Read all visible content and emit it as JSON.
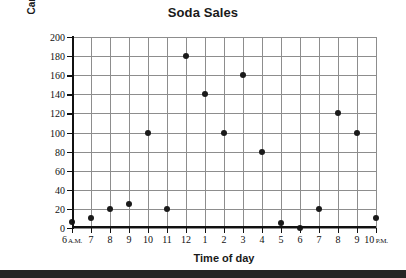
{
  "chart_data": {
    "type": "scatter",
    "title": "Soda Sales",
    "xlabel": "Time of day",
    "ylabel": "Cans sold per hour",
    "grid": true,
    "legend": null,
    "ylim": [
      0,
      200
    ],
    "yticks": [
      0,
      20,
      40,
      60,
      80,
      100,
      120,
      140,
      160,
      180,
      200
    ],
    "ytick_labels": [
      "0",
      "20",
      "40",
      "60",
      "80",
      "100",
      "120",
      "140",
      "160",
      "180",
      "200"
    ],
    "categories": [
      "6 A.M.",
      "7",
      "8",
      "9",
      "10",
      "11",
      "12",
      "1",
      "2",
      "3",
      "4",
      "5",
      "6",
      "7",
      "8",
      "9",
      "10 P.M."
    ],
    "xtick_labels": [
      {
        "number": "6",
        "suffix": " A.M."
      },
      {
        "number": "7",
        "suffix": ""
      },
      {
        "number": "8",
        "suffix": ""
      },
      {
        "number": "9",
        "suffix": ""
      },
      {
        "number": "10",
        "suffix": ""
      },
      {
        "number": "11",
        "suffix": ""
      },
      {
        "number": "12",
        "suffix": ""
      },
      {
        "number": "1",
        "suffix": ""
      },
      {
        "number": "2",
        "suffix": ""
      },
      {
        "number": "3",
        "suffix": ""
      },
      {
        "number": "4",
        "suffix": ""
      },
      {
        "number": "5",
        "suffix": ""
      },
      {
        "number": "6",
        "suffix": ""
      },
      {
        "number": "7",
        "suffix": ""
      },
      {
        "number": "8",
        "suffix": ""
      },
      {
        "number": "9",
        "suffix": ""
      },
      {
        "number": "10",
        "suffix": " P.M."
      }
    ],
    "values": [
      6,
      10,
      20,
      25,
      100,
      20,
      180,
      140,
      100,
      160,
      80,
      5,
      0,
      20,
      120,
      100,
      10
    ],
    "marker_color": "#1a1a1a",
    "grid_color": "#8d8d8d",
    "axis_color": "#111111",
    "background_color": "#ffffff",
    "footer_bar_color": "#262626"
  }
}
